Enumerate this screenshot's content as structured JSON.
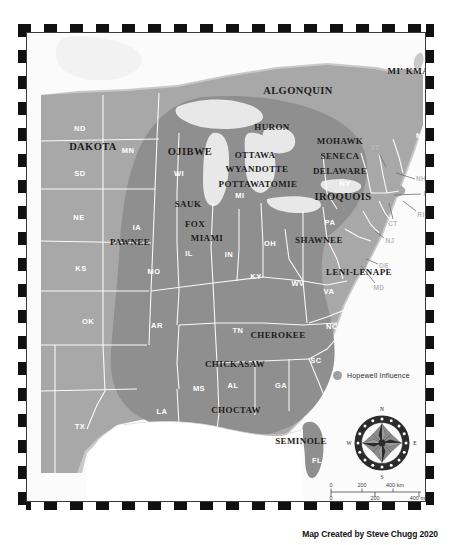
{
  "map": {
    "title": "Native American Tribal Territories",
    "credit": "Map Created by Steve Chugg 2020",
    "colors": {
      "land_outside": "#c9c9c9",
      "land_base": "#a8a8a8",
      "hopewell_influence": "#8f8f8f",
      "water": "#f2f2f2",
      "great_lakes": "#e8e8e8",
      "state_border": "#ffffff",
      "tribe_label": "#1d1d1d",
      "state_label": "#ffffff",
      "outside_state_label": "#b9b9b9",
      "frame_dash": "#111111"
    }
  },
  "legend": {
    "label": "Hopewell Influence",
    "swatch_color": "#9e9e9e"
  },
  "compass": {
    "north": "N",
    "east": "E",
    "south": "S",
    "west": "W"
  },
  "scalebar": {
    "km": {
      "unit": "400 km",
      "ticks": [
        "0",
        "200",
        "400 km"
      ]
    },
    "mi": {
      "unit": "400 mi",
      "ticks": [
        "0",
        "200",
        "400 mi"
      ]
    },
    "km_labels": [
      "0",
      "200",
      "400 km"
    ],
    "mi_labels": [
      "0",
      "200",
      "400 mi"
    ]
  },
  "tribes": [
    {
      "name": "ALGONQUIN",
      "x": 271,
      "y": 57,
      "size": "lg"
    },
    {
      "name": "MI' KMAQ",
      "x": 385,
      "y": 38,
      "size": "md"
    },
    {
      "name": "HURON",
      "x": 245,
      "y": 94,
      "size": "md"
    },
    {
      "name": "DAKOTA",
      "x": 66,
      "y": 113,
      "size": "lg"
    },
    {
      "name": "MOHAWK",
      "x": 313,
      "y": 108,
      "size": "md"
    },
    {
      "name": "OJIBWE",
      "x": 163,
      "y": 118,
      "size": "lg"
    },
    {
      "name": "SENECA",
      "x": 313,
      "y": 123,
      "size": "md"
    },
    {
      "name": "OTTAWA",
      "x": 228,
      "y": 122,
      "size": "md"
    },
    {
      "name": "WYANDOTTE",
      "x": 230,
      "y": 136,
      "size": "md"
    },
    {
      "name": "DELAWARE",
      "x": 313,
      "y": 138,
      "size": "md"
    },
    {
      "name": "POTTAWATOMIE",
      "x": 231,
      "y": 151,
      "size": "md"
    },
    {
      "name": "IROQUOIS",
      "x": 316,
      "y": 163,
      "size": "lg"
    },
    {
      "name": "SAUK",
      "x": 161,
      "y": 171,
      "size": "md"
    },
    {
      "name": "FOX",
      "x": 168,
      "y": 191,
      "size": "md"
    },
    {
      "name": "MIAMI",
      "x": 180,
      "y": 205,
      "size": "md"
    },
    {
      "name": "PAWNEE",
      "x": 103,
      "y": 209,
      "size": "md"
    },
    {
      "name": "SHAWNEE",
      "x": 292,
      "y": 207,
      "size": "md"
    },
    {
      "name": "LENI-LENAPE",
      "x": 332,
      "y": 239,
      "size": "md"
    },
    {
      "name": "CHEROKEE",
      "x": 251,
      "y": 302,
      "size": "md"
    },
    {
      "name": "CHICKASAW",
      "x": 208,
      "y": 331,
      "size": "md"
    },
    {
      "name": "CHOCTAW",
      "x": 209,
      "y": 377,
      "size": "md"
    },
    {
      "name": "SEMINOLE",
      "x": 274,
      "y": 408,
      "size": "md"
    }
  ],
  "states": [
    {
      "abbr": "ND",
      "x": 53,
      "y": 95
    },
    {
      "abbr": "MN",
      "x": 101,
      "y": 117
    },
    {
      "abbr": "WI",
      "x": 152,
      "y": 140
    },
    {
      "abbr": "SD",
      "x": 53,
      "y": 140
    },
    {
      "abbr": "MI",
      "x": 213,
      "y": 162
    },
    {
      "abbr": "NY",
      "x": 318,
      "y": 150
    },
    {
      "abbr": "ME",
      "x": 395,
      "y": 102
    },
    {
      "abbr": "NE",
      "x": 52,
      "y": 184
    },
    {
      "abbr": "IA",
      "x": 110,
      "y": 194
    },
    {
      "abbr": "IL",
      "x": 162,
      "y": 220
    },
    {
      "abbr": "IN",
      "x": 202,
      "y": 221
    },
    {
      "abbr": "OH",
      "x": 243,
      "y": 210
    },
    {
      "abbr": "PA",
      "x": 303,
      "y": 189
    },
    {
      "abbr": "KS",
      "x": 54,
      "y": 235
    },
    {
      "abbr": "MO",
      "x": 127,
      "y": 238
    },
    {
      "abbr": "KY",
      "x": 229,
      "y": 243
    },
    {
      "abbr": "WV",
      "x": 271,
      "y": 250
    },
    {
      "abbr": "VA",
      "x": 302,
      "y": 258
    },
    {
      "abbr": "OK",
      "x": 61,
      "y": 288
    },
    {
      "abbr": "AR",
      "x": 130,
      "y": 292
    },
    {
      "abbr": "TN",
      "x": 211,
      "y": 297
    },
    {
      "abbr": "NC",
      "x": 305,
      "y": 293
    },
    {
      "abbr": "SC",
      "x": 289,
      "y": 327
    },
    {
      "abbr": "MS",
      "x": 172,
      "y": 355
    },
    {
      "abbr": "AL",
      "x": 206,
      "y": 352
    },
    {
      "abbr": "GA",
      "x": 254,
      "y": 352
    },
    {
      "abbr": "LA",
      "x": 135,
      "y": 378
    },
    {
      "abbr": "TX",
      "x": 53,
      "y": 393
    },
    {
      "abbr": "FL",
      "x": 290,
      "y": 427
    }
  ],
  "callout_states": [
    {
      "abbr": "VT",
      "x": 348,
      "y": 114,
      "lx1": 352,
      "ly1": 120,
      "lx2": 359,
      "ly2": 134
    },
    {
      "abbr": "NH",
      "x": 394,
      "y": 145,
      "lx1": 388,
      "ly1": 146,
      "lx2": 369,
      "ly2": 140
    },
    {
      "abbr": "MA",
      "x": 402,
      "y": 160,
      "lx1": 394,
      "ly1": 161,
      "lx2": 367,
      "ly2": 162
    },
    {
      "abbr": "RI",
      "x": 394,
      "y": 181,
      "lx1": 389,
      "ly1": 178,
      "lx2": 376,
      "ly2": 168
    },
    {
      "abbr": "CT",
      "x": 366,
      "y": 190,
      "lx1": 366,
      "ly1": 186,
      "lx2": 362,
      "ly2": 170
    },
    {
      "abbr": "NJ",
      "x": 363,
      "y": 207,
      "lx1": 357,
      "ly1": 205,
      "lx2": 348,
      "ly2": 198
    },
    {
      "abbr": "DE",
      "x": 357,
      "y": 232,
      "lx1": 351,
      "ly1": 231,
      "lx2": 339,
      "ly2": 226
    },
    {
      "abbr": "MD",
      "x": 352,
      "y": 254,
      "lx1": 348,
      "ly1": 250,
      "lx2": 334,
      "ly2": 233
    }
  ]
}
